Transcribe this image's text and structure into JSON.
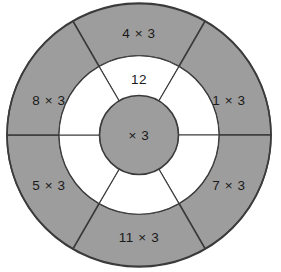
{
  "figure": {
    "type": "multiplication-wheel",
    "center_label": "× 3",
    "colors": {
      "segment_fill": "#9d9d9d",
      "inner_fill": "#ffffff",
      "stroke": "#3b3b3b",
      "background": "#ffffff",
      "text": "#1a1a1a"
    },
    "geometry": {
      "cx": 139,
      "cy": 135,
      "outer_radius": 132,
      "ring_radius": 80,
      "hub_radius": 39
    }
  },
  "outer_ring": {
    "segments": [
      {
        "position": "top",
        "label": "4 × 3",
        "start_angle": -120,
        "end_angle": -60,
        "label_x": 139,
        "label_y": 33
      },
      {
        "position": "upper-right",
        "label": "1 × 3",
        "start_angle": -60,
        "end_angle": 0,
        "label_x": 228,
        "label_y": 100
      },
      {
        "position": "lower-right",
        "label": "7 × 3",
        "start_angle": 0,
        "end_angle": 60,
        "label_x": 228,
        "label_y": 185
      },
      {
        "position": "bottom",
        "label": "11 × 3",
        "start_angle": 60,
        "end_angle": 120,
        "label_x": 139,
        "label_y": 238
      },
      {
        "position": "lower-left",
        "label": "5 × 3",
        "start_angle": 120,
        "end_angle": 180,
        "label_x": 49,
        "label_y": 185
      },
      {
        "position": "upper-left",
        "label": "8 × 3",
        "start_angle": 180,
        "end_angle": 240,
        "label_x": 49,
        "label_y": 100
      }
    ]
  },
  "inner_ring": {
    "segments": [
      {
        "position": "top",
        "label": "12",
        "label_x": 139,
        "label_y": 79
      },
      {
        "position": "upper-right",
        "label": "",
        "label_x": 196,
        "label_y": 111
      },
      {
        "position": "lower-right",
        "label": "",
        "label_x": 196,
        "label_y": 164
      },
      {
        "position": "bottom",
        "label": "",
        "label_x": 139,
        "label_y": 193
      },
      {
        "position": "lower-left",
        "label": "",
        "label_x": 82,
        "label_y": 164
      },
      {
        "position": "upper-left",
        "label": "",
        "label_x": 82,
        "label_y": 111
      }
    ]
  }
}
